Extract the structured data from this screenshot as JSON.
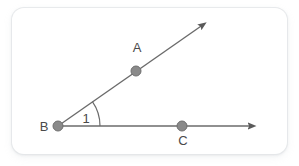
{
  "figure": {
    "background_color": "#ffffff",
    "card": {
      "fill": "#ffffff",
      "border_color": "#e4e6e9",
      "corner_radius": 12
    },
    "stroke_color": "#6b6b6b",
    "point_fill": "#8a8a8a",
    "point_stroke": "#6f6f6f",
    "label_color": "#4a4a4a",
    "points": [
      {
        "id": "A",
        "label": "A",
        "x": 136,
        "y": 71,
        "label_x": 137,
        "label_y": 52,
        "radius": 5
      },
      {
        "id": "B",
        "label": "B",
        "x": 58,
        "y": 126,
        "label_x": 44,
        "label_y": 131,
        "radius": 5
      },
      {
        "id": "C",
        "label": "C",
        "x": 182,
        "y": 126,
        "label_x": 183,
        "label_y": 145,
        "radius": 5
      }
    ],
    "rays": [
      {
        "id": "ray-BA",
        "from": "B",
        "through": "A",
        "x1": 58,
        "y1": 126,
        "x2": 207,
        "y2": 22,
        "arrow": "end"
      },
      {
        "id": "ray-BC",
        "from": "B",
        "through": "C",
        "x1": 58,
        "y1": 126,
        "x2": 256,
        "y2": 126,
        "arrow": "end"
      }
    ],
    "angle": {
      "id": "angle-1",
      "label": "1",
      "vertex": "B",
      "label_x": 86,
      "label_y": 123,
      "arc_radius": 42,
      "degrees": 35,
      "arc_path": "M 100 126 A 42 42 0 0 0 92.4 101.6"
    }
  }
}
